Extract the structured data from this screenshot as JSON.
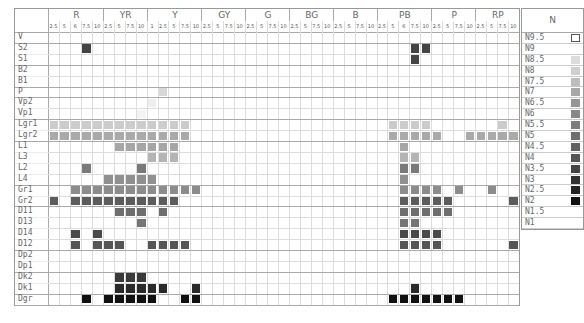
{
  "chart_data": {
    "type": "heatmap",
    "title": "",
    "hue_groups": [
      {
        "name": "R",
        "values": [
          "2.5",
          "5",
          "6",
          "7.5",
          "10"
        ]
      },
      {
        "name": "YR",
        "values": [
          "2.5",
          "5",
          "7.5",
          "10"
        ]
      },
      {
        "name": "Y",
        "values": [
          "1",
          "2.5",
          "5",
          "7.5",
          "10"
        ]
      },
      {
        "name": "GY",
        "values": [
          "2.5",
          "5",
          "7.5",
          "10"
        ]
      },
      {
        "name": "G",
        "values": [
          "2.5",
          "5",
          "7.5",
          "10"
        ]
      },
      {
        "name": "BG",
        "values": [
          "2.5",
          "5",
          "7.5",
          "10"
        ]
      },
      {
        "name": "B",
        "values": [
          "2.5",
          "5",
          "7.5",
          "10"
        ]
      },
      {
        "name": "PB",
        "values": [
          "2.5",
          "5",
          "6",
          "7.5",
          "10"
        ]
      },
      {
        "name": "P",
        "values": [
          "2.5",
          "5",
          "7.5",
          "10"
        ]
      },
      {
        "name": "RP",
        "values": [
          "2.5",
          "5",
          "7.5",
          "10"
        ]
      }
    ],
    "row_groups": [
      [
        "V"
      ],
      [
        "S2",
        "S1"
      ],
      [
        "B2",
        "B1"
      ],
      [
        "P"
      ],
      [
        "Vp2",
        "Vp1"
      ],
      [
        "Lgr1",
        "Lgr2"
      ],
      [
        "L1",
        "L3",
        "L2",
        "L4"
      ],
      [
        "Gr1",
        "Gr2"
      ],
      [
        "D11",
        "D13",
        "D14",
        "D12"
      ],
      [
        "Dp2",
        "Dp1"
      ],
      [
        "Dk2",
        "Dk1"
      ],
      [
        "Dgr"
      ]
    ],
    "rows": [
      {
        "label": "V",
        "color": "#ffffff",
        "cols": []
      },
      {
        "label": "S2",
        "color": "#444444",
        "cols": [
          3,
          33,
          34
        ]
      },
      {
        "label": "S1",
        "color": "#444444",
        "cols": [
          33
        ]
      },
      {
        "label": "B2",
        "color": "#e8e8e8",
        "cols": []
      },
      {
        "label": "B1",
        "color": "#e8e8e8",
        "cols": []
      },
      {
        "label": "P",
        "color": "#d8d8d8",
        "cols": [
          10
        ]
      },
      {
        "label": "Vp2",
        "color": "#eeeeee",
        "cols": [
          9
        ]
      },
      {
        "label": "Vp1",
        "color": "#f3f3f3",
        "cols": [
          8
        ]
      },
      {
        "label": "Lgr1",
        "color": "#cccccc",
        "cols": [
          0,
          1,
          2,
          3,
          4,
          5,
          6,
          7,
          8,
          9,
          10,
          11,
          12,
          31,
          32,
          33,
          34,
          41
        ]
      },
      {
        "label": "Lgr2",
        "color": "#aaaaaa",
        "cols": [
          0,
          1,
          2,
          3,
          4,
          5,
          6,
          7,
          8,
          9,
          10,
          11,
          12,
          31,
          32,
          33,
          34,
          35,
          38,
          39,
          40,
          41,
          42
        ]
      },
      {
        "label": "L1",
        "color": "#a6a6a6",
        "cols": [
          6,
          7,
          8,
          9,
          10,
          11,
          32
        ]
      },
      {
        "label": "L3",
        "color": "#b4b4b4",
        "cols": [
          9,
          10,
          11,
          32,
          33
        ]
      },
      {
        "label": "L2",
        "color": "#7a7a7a",
        "cols": [
          3,
          8,
          32,
          33
        ]
      },
      {
        "label": "L4",
        "color": "#909090",
        "cols": [
          5,
          6,
          7,
          8,
          9,
          32
        ]
      },
      {
        "label": "Gr1",
        "color": "#8c8c8c",
        "cols": [
          2,
          3,
          4,
          5,
          6,
          7,
          8,
          9,
          10,
          11,
          12,
          13,
          32,
          33,
          34,
          35,
          37,
          40
        ]
      },
      {
        "label": "Gr2",
        "color": "#5c5c5c",
        "cols": [
          0,
          2,
          3,
          4,
          5,
          6,
          7,
          8,
          9,
          10,
          11,
          32,
          33,
          34,
          35,
          36,
          42
        ]
      },
      {
        "label": "D11",
        "color": "#6e6e6e",
        "cols": [
          6,
          7,
          8,
          10,
          32,
          33,
          34,
          35,
          36
        ]
      },
      {
        "label": "D13",
        "color": "#767676",
        "cols": [
          8,
          32,
          33
        ]
      },
      {
        "label": "D14",
        "color": "#4a4a4a",
        "cols": [
          2,
          4,
          32,
          33,
          34,
          35
        ]
      },
      {
        "label": "D12",
        "color": "#555555",
        "cols": [
          2,
          4,
          5,
          6,
          9,
          10,
          11,
          12,
          32,
          33,
          34,
          35,
          42
        ]
      },
      {
        "label": "Dp2",
        "color": "#ffffff",
        "cols": []
      },
      {
        "label": "Dp1",
        "color": "#ffffff",
        "cols": []
      },
      {
        "label": "Dk2",
        "color": "#3a3a3a",
        "cols": [
          6,
          7,
          8
        ]
      },
      {
        "label": "Dk1",
        "color": "#2a2a2a",
        "cols": [
          6,
          7,
          8,
          9,
          10,
          13,
          33
        ]
      },
      {
        "label": "Dgr",
        "color": "#111111",
        "cols": [
          3,
          5,
          6,
          7,
          8,
          9,
          12,
          13,
          31,
          32,
          33,
          34,
          35,
          36,
          37
        ]
      }
    ],
    "neutral_scale": {
      "title": "N",
      "levels": [
        {
          "label": "N9.5",
          "color": "#ffffff",
          "outlined": true
        },
        {
          "label": "N9",
          "color": "#ffffff"
        },
        {
          "label": "N8.5",
          "color": "#dcdcdc"
        },
        {
          "label": "N8",
          "color": "#cfcfcf"
        },
        {
          "label": "N7.5",
          "color": "#bdbdbd"
        },
        {
          "label": "N7",
          "color": "#a8a8a8"
        },
        {
          "label": "N6.5",
          "color": "#969696"
        },
        {
          "label": "N6",
          "color": "#888888"
        },
        {
          "label": "N5.5",
          "color": "#7c7c7c"
        },
        {
          "label": "N5",
          "color": "#6e6e6e"
        },
        {
          "label": "N4.5",
          "color": "#626262"
        },
        {
          "label": "N4",
          "color": "#555555"
        },
        {
          "label": "N3.5",
          "color": "#454545"
        },
        {
          "label": "N3",
          "color": "#333333"
        },
        {
          "label": "N2.5",
          "color": "#222222"
        },
        {
          "label": "N2",
          "color": "#111111"
        },
        {
          "label": "N1.5",
          "color": "#ffffff"
        },
        {
          "label": "N1",
          "color": "#ffffff"
        }
      ]
    }
  }
}
